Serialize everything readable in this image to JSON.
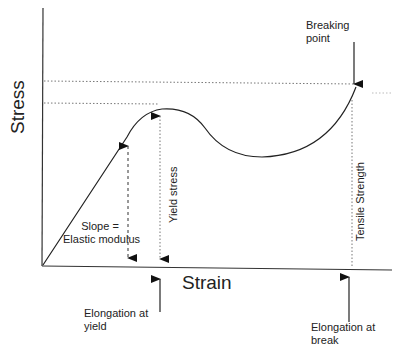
{
  "diagram": {
    "type": "stress-strain curve",
    "axes": {
      "y_label": "Stress",
      "x_label": "Strain"
    },
    "annotations": {
      "breaking_point": [
        "Breaking",
        "point"
      ],
      "slope": [
        "Slope =",
        "Elastic modulus"
      ],
      "yield_stress": "Yield stress",
      "tensile_strength": "Tensile Strength",
      "elongation_yield": [
        "Elongation at",
        "yield"
      ],
      "elongation_break": [
        "Elongation at",
        "break"
      ]
    },
    "colors": {
      "line": "#222222",
      "dotted": "#777777",
      "background": "#ffffff"
    }
  }
}
